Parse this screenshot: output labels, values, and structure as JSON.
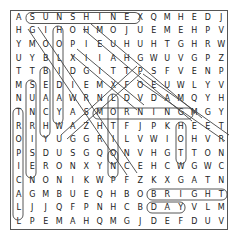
{
  "puzzle": {
    "cols": 16,
    "rows": 16,
    "grid": [
      "ASUNSHINEXQMHEDJ",
      "HGIHOHMOJUEMEHPV",
      "YMOOPIEUHUHTGHRW",
      "UYBLXIIAHGWUVGPZ",
      "TTBIDGITTPSFVENP",
      "MSEDIEMXFOEUWLYV",
      "NUAAWRNLDVDAMQYH",
      "TNCYASMORNINGMGY",
      "RRHWAZHTFJPKHEET",
      "OIYUGGRILVWIOHVR",
      "PSDUSGQONVHGTTON",
      "IERONXYNCEHCWGWC",
      "CNONIKWPFZKXGATN",
      "AGMBUEQHBOBRIGHT",
      "LJJQFPNHCBDAYVLM",
      "LPEMAHQMGJDEFDUV"
    ],
    "found_words": [
      {
        "word": "SUNSHINE",
        "start": [
          0,
          1
        ],
        "end": [
          0,
          8
        ]
      },
      {
        "word": "MORNING",
        "start": [
          7,
          6
        ],
        "end": [
          7,
          12
        ]
      },
      {
        "word": "BRIGHT",
        "start": [
          13,
          10
        ],
        "end": [
          13,
          15
        ]
      },
      {
        "word": "DAY",
        "start": [
          14,
          10
        ],
        "end": [
          14,
          12
        ]
      },
      {
        "word": "TROPICAL",
        "start": [
          7,
          0
        ],
        "end": [
          14,
          0
        ]
      },
      {
        "word": "SUNRISE",
        "start": [
          5,
          1
        ],
        "end": [
          11,
          1
        ]
      },
      {
        "word": "BEACH",
        "start": [
          4,
          2
        ],
        "end": [
          8,
          2
        ]
      },
      {
        "word": "HOLIDAY",
        "start": [
          1,
          3
        ],
        "end": [
          7,
          3
        ]
      },
      {
        "word": "LIGHT",
        "start": [
          6,
          7
        ],
        "end": [
          10,
          7
        ]
      },
      {
        "word": "HOT",
        "start": [
          8,
          12
        ],
        "end": [
          10,
          12
        ]
      },
      {
        "word": "GLOW",
        "start": [
          1,
          1
        ],
        "end": [
          4,
          4
        ]
      },
      {
        "word": "WARM",
        "start": [
          8,
          3
        ],
        "end": [
          5,
          6
        ]
      },
      {
        "word": "SUN",
        "start": [
          4,
          10
        ],
        "end": [
          6,
          12
        ]
      },
      {
        "word": "HUMIDITY",
        "start": [
          0,
          5
        ],
        "end": [
          7,
          12
        ]
      },
      {
        "word": "SEASON",
        "start": [
          7,
          5
        ],
        "end": [
          12,
          9
        ]
      },
      {
        "word": "HEAT",
        "start": [
          1,
          5
        ],
        "end": [
          4,
          8
        ]
      },
      {
        "word": "WEATHER",
        "start": [
          3,
          10
        ],
        "end": [
          9,
          15
        ]
      },
      {
        "word": "WATER",
        "start": [
          8,
          3
        ],
        "end": [
          3,
          8
        ]
      }
    ]
  }
}
